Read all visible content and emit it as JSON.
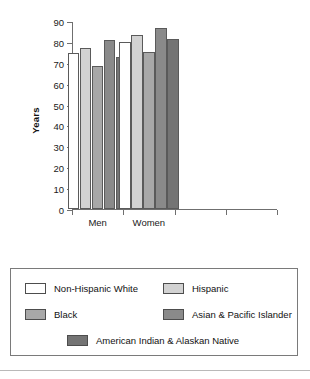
{
  "chart_data": {
    "type": "bar",
    "title": "",
    "xlabel": "",
    "ylabel": "Years",
    "ylim": [
      0,
      90
    ],
    "ytick_step": 10,
    "yticks": [
      "90",
      "80",
      "70",
      "60",
      "50",
      "40",
      "30",
      "20",
      "10",
      "0"
    ],
    "categories": [
      "Men",
      "Women"
    ],
    "grid": false,
    "legend_position": "below",
    "series": [
      {
        "name": "Non-Hispanic White",
        "color": "#ffffff",
        "values": [
          74.5,
          80.0
        ]
      },
      {
        "name": "Hispanic",
        "color": "#d2d2d2",
        "values": [
          77.0,
          83.5
        ]
      },
      {
        "name": "Black",
        "color": "#a8a8a8",
        "values": [
          68.5,
          75.0
        ]
      },
      {
        "name": "Asian & Pacific Islander",
        "color": "#8a8a8a",
        "values": [
          81.0,
          86.5
        ]
      },
      {
        "name": "American Indian & Alaskan Native",
        "color": "#747474",
        "values": [
          73.0,
          81.5
        ]
      }
    ]
  },
  "legend": {
    "rows": [
      [
        "Non-Hispanic White",
        "Hispanic"
      ],
      [
        "Black",
        "Asian & Pacific Islander"
      ],
      [
        "American Indian & Alaskan Native"
      ]
    ]
  }
}
